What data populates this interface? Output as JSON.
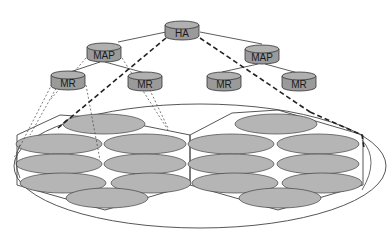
{
  "diagram": {
    "type": "hierarchical-network-coverage",
    "colors": {
      "node_fill": "#9a9a9a",
      "node_top": "#b0b0b0",
      "stroke": "#333333",
      "cell_fill": "#b5b5b5",
      "background": "#ffffff"
    },
    "nodes": [
      {
        "id": "ha",
        "label": "HA",
        "level": 0
      },
      {
        "id": "map-left",
        "label": "MAP",
        "level": 1
      },
      {
        "id": "map-right",
        "label": "MAP",
        "level": 1
      },
      {
        "id": "mr-1",
        "label": "MR",
        "level": 2
      },
      {
        "id": "mr-2",
        "label": "MR",
        "level": 2
      },
      {
        "id": "mr-3",
        "label": "MR",
        "level": 2
      },
      {
        "id": "mr-4",
        "label": "MR",
        "level": 2
      }
    ],
    "edges": [
      {
        "from": "ha",
        "to": "map-left",
        "style": "solid"
      },
      {
        "from": "ha",
        "to": "map-right",
        "style": "solid"
      },
      {
        "from": "map-left",
        "to": "mr-1",
        "style": "solid"
      },
      {
        "from": "map-left",
        "to": "mr-2",
        "style": "solid"
      },
      {
        "from": "map-right",
        "to": "mr-3",
        "style": "solid"
      },
      {
        "from": "map-right",
        "to": "mr-4",
        "style": "solid"
      },
      {
        "from": "ha",
        "to": "left-region",
        "style": "bold-dashed"
      },
      {
        "from": "ha",
        "to": "right-region",
        "style": "bold-dashed"
      },
      {
        "from": "map-left",
        "to": "left-region",
        "style": "dotted"
      },
      {
        "from": "mr-1",
        "to": "left-cells",
        "style": "dotted"
      },
      {
        "from": "mr-2",
        "to": "left-cells",
        "style": "dotted"
      }
    ],
    "regions": [
      {
        "id": "left-region",
        "shape": "hexagon",
        "cells": 9
      },
      {
        "id": "right-region",
        "shape": "hexagon",
        "cells": 9
      },
      {
        "id": "outer-domain",
        "shape": "ellipse"
      }
    ]
  }
}
